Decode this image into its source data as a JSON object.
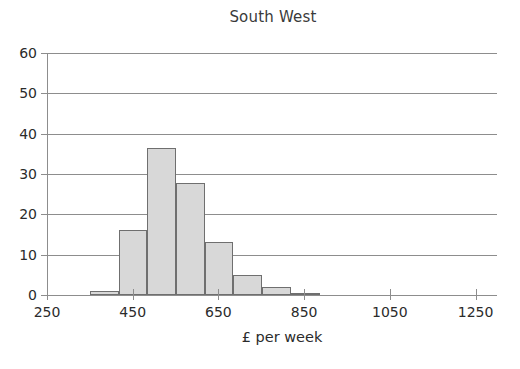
{
  "chart_data": {
    "type": "bar",
    "title": "South West",
    "xlabel": "£ per week",
    "ylabel": "",
    "grid": true,
    "legend": "none",
    "xlim": [
      250,
      1300
    ],
    "ylim": [
      0,
      60
    ],
    "xticks": [
      250,
      450,
      650,
      850,
      1050,
      1250
    ],
    "xtick_labels": [
      "250",
      "450",
      "650",
      "850",
      "1050",
      "1250"
    ],
    "yticks": [
      0,
      10,
      20,
      30,
      40,
      50,
      60
    ],
    "ytick_labels": [
      "0",
      "10",
      "20",
      "30",
      "40",
      "50",
      "60"
    ],
    "bin_width": 67,
    "bars": [
      {
        "bin_start": 350,
        "bin_end": 417,
        "label": "350-417",
        "value": 1
      },
      {
        "bin_start": 417,
        "bin_end": 484,
        "label": "417-484",
        "value": 16
      },
      {
        "bin_start": 484,
        "bin_end": 551,
        "label": "484-551",
        "value": 36.5
      },
      {
        "bin_start": 551,
        "bin_end": 618,
        "label": "551-618",
        "value": 27.8
      },
      {
        "bin_start": 618,
        "bin_end": 685,
        "label": "618-685",
        "value": 13.2
      },
      {
        "bin_start": 685,
        "bin_end": 752,
        "label": "685-752",
        "value": 5
      },
      {
        "bin_start": 752,
        "bin_end": 819,
        "label": "752-819",
        "value": 2
      },
      {
        "bin_start": 819,
        "bin_end": 886,
        "label": "819-886",
        "value": 0.5
      }
    ],
    "categories": [
      "350-417",
      "417-484",
      "484-551",
      "551-618",
      "618-685",
      "685-752",
      "752-819",
      "819-886"
    ],
    "values": [
      1,
      16,
      36.5,
      27.8,
      13.2,
      5,
      2,
      0.5
    ],
    "colors": {
      "bar_fill": "#d8d8d8",
      "bar_border": "#6f6f6f",
      "axis": "#8d8d8d",
      "text": "#2b2b2b",
      "background": "#ffffff"
    }
  }
}
